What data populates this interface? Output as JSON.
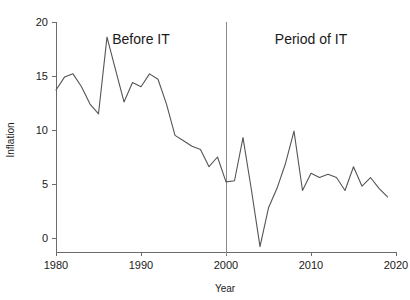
{
  "chart_data": {
    "type": "line",
    "title": "",
    "xlabel": "Year",
    "ylabel": "Inflation",
    "xlim": [
      1980,
      2020
    ],
    "ylim": [
      -2,
      20
    ],
    "grid": false,
    "legend": "none",
    "xticks": [
      1980,
      1990,
      2000,
      2010,
      2020
    ],
    "yticks": [
      0,
      5,
      10,
      15,
      20
    ],
    "xtick_labels": [
      "1980",
      "1990",
      "2000",
      "2010",
      "2020"
    ],
    "ytick_labels": [
      "0",
      "5",
      "10",
      "15",
      "20"
    ],
    "x": [
      1980,
      1981,
      1982,
      1983,
      1984,
      1985,
      1986,
      1987,
      1988,
      1989,
      1990,
      1991,
      1992,
      1993,
      1994,
      1995,
      1996,
      1997,
      1998,
      1999,
      2000,
      2001,
      2002,
      2003,
      2004,
      2005,
      2006,
      2007,
      2008,
      2009,
      2010,
      2011,
      2012,
      2013,
      2014,
      2015,
      2016,
      2017,
      2018,
      2019
    ],
    "values": [
      13.7,
      14.9,
      15.2,
      14.0,
      12.4,
      11.5,
      18.6,
      15.6,
      12.6,
      14.4,
      14.0,
      15.2,
      14.7,
      12.4,
      9.5,
      9.0,
      8.5,
      8.2,
      6.6,
      7.5,
      5.2,
      5.3,
      9.3,
      4.4,
      -0.8,
      2.8,
      4.6,
      6.9,
      9.9,
      4.4,
      6.0,
      5.6,
      5.9,
      5.6,
      4.4,
      6.6,
      4.8,
      5.6,
      4.6,
      3.8
    ],
    "annotations": [
      {
        "text": "Before IT",
        "x": 1990,
        "y": 18.0
      },
      {
        "text": "Period of IT",
        "x": 2010,
        "y": 18.0
      }
    ],
    "vertical_divider": {
      "x": 2000,
      "y_top": 20.0,
      "y_bottom": -1.6
    },
    "series_color": "#555555",
    "axis_color": "#6b6b6b"
  }
}
